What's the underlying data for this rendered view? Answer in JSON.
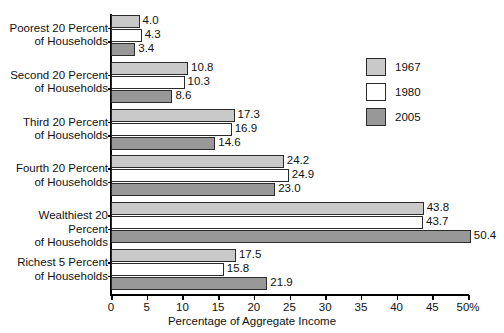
{
  "chart_data": {
    "type": "bar",
    "orientation": "horizontal",
    "title": "",
    "xlabel": "Percentage of Aggregate Income",
    "ylabel": "",
    "xlim": [
      0,
      50
    ],
    "xticks": [
      0,
      5,
      10,
      15,
      20,
      25,
      30,
      35,
      40,
      45,
      50
    ],
    "xtick_labels": [
      "0",
      "5",
      "10",
      "15",
      "20",
      "25",
      "30",
      "35",
      "40",
      "45",
      "50%"
    ],
    "grid": false,
    "legend_position": "upper right",
    "categories": [
      "Poorest 20 Percent of Households",
      "Second 20 Percent of Households",
      "Third 20 Percent of Households",
      "Fourth 20 Percent of Households",
      "Wealthiest 20 Percent of Households",
      "Richest 5 Percent of Households"
    ],
    "category_lines": [
      [
        "Poorest 20 Percent",
        "of Households"
      ],
      [
        "Second 20 Percent",
        "of Households"
      ],
      [
        "Third 20 Percent",
        "of Households"
      ],
      [
        "Fourth 20 Percent",
        "of Households"
      ],
      [
        "Wealthiest 20 Percent",
        "of Households"
      ],
      [
        "Richest 5 Percent",
        "of Households"
      ]
    ],
    "series": [
      {
        "name": "1967",
        "color": "#c9c9c9",
        "values": [
          4.0,
          10.8,
          17.3,
          24.2,
          43.8,
          17.5
        ],
        "labels": [
          "4.0",
          "10.8",
          "17.3",
          "24.2",
          "43.8",
          "17.5"
        ]
      },
      {
        "name": "1980",
        "color": "#ffffff",
        "values": [
          4.3,
          10.3,
          16.9,
          24.9,
          43.7,
          15.8
        ],
        "labels": [
          "4.3",
          "10.3",
          "16.9",
          "24.9",
          "43.7",
          "15.8"
        ]
      },
      {
        "name": "2005",
        "color": "#989898",
        "values": [
          3.4,
          8.6,
          14.6,
          23.0,
          50.4,
          21.9
        ],
        "labels": [
          "3.4",
          "8.6",
          "14.6",
          "23.0",
          "50.4",
          "21.9"
        ]
      }
    ]
  },
  "legend": {
    "items": [
      {
        "label": "1967",
        "swatch_class": "s1967"
      },
      {
        "label": "1980",
        "swatch_class": "s1980"
      },
      {
        "label": "2005",
        "swatch_class": "s2005"
      }
    ]
  }
}
